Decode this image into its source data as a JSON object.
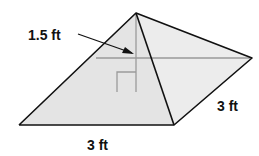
{
  "figure": {
    "type": "square-pyramid",
    "labels": {
      "height": "1.5 ft",
      "base_front": "3 ft",
      "base_side": "3 ft"
    },
    "colors": {
      "face_fill": "#e6e6e6",
      "face_fill_right": "#ececec",
      "edge": "#111111",
      "hidden_line": "#9a9a9a"
    }
  }
}
